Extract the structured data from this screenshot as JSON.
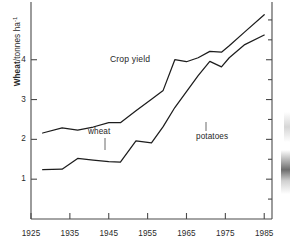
{
  "figure": {
    "inline_title": "Crop yield",
    "y_axis_label_bold": "Wheat",
    "y_axis_label_rest": "/tonnes ha",
    "y_axis_label_exponent": "-1",
    "annotations": [
      {
        "name": "wheat",
        "label": "wheat"
      },
      {
        "name": "potatoes",
        "label": "potatoes"
      }
    ]
  },
  "chart_data": {
    "type": "line",
    "title": "Crop yield",
    "xlabel": "",
    "ylabel": "Wheat/tonnes ha-1",
    "xlim": [
      1925,
      1987
    ],
    "ylim": [
      0,
      5.45
    ],
    "grid": false,
    "legend": "inline-annotations",
    "xticks": [
      1925,
      1935,
      1945,
      1955,
      1965,
      1975,
      1985
    ],
    "yticks": [
      1,
      2,
      3,
      4
    ],
    "x": [
      1928,
      1933,
      1937,
      1941,
      1945,
      1948,
      1952,
      1956,
      1959,
      1962,
      1965,
      1968,
      1971,
      1974,
      1976,
      1980,
      1985
    ],
    "series": [
      {
        "name": "wheat",
        "label": "wheat",
        "values": [
          2.16,
          2.29,
          2.23,
          2.31,
          2.42,
          2.42,
          2.72,
          3.01,
          3.23,
          4.0,
          3.95,
          4.05,
          4.21,
          4.19,
          4.35,
          4.7,
          5.13
        ]
      },
      {
        "name": "potatoes",
        "label": "potatoes",
        "values": [
          1.24,
          1.25,
          1.52,
          1.48,
          1.44,
          1.43,
          1.96,
          1.91,
          2.32,
          2.8,
          3.2,
          3.6,
          3.96,
          3.82,
          4.05,
          4.38,
          4.62
        ]
      }
    ]
  },
  "axis_tick_labels": {
    "x": [
      "1925",
      "1935",
      "1945",
      "1955",
      "1965",
      "1975",
      "1985"
    ],
    "y": [
      "1",
      "2",
      "3",
      "4"
    ]
  }
}
